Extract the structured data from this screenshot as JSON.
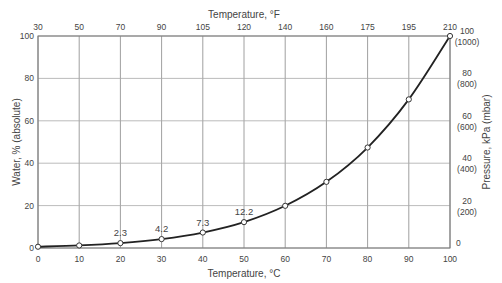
{
  "chart_data": {
    "type": "line",
    "title": "",
    "xlabel": "Temperature, °C",
    "x2label": "Temperature, °F",
    "ylabel": "Water, % (absolute)",
    "y2label": "Pressure, kPa (mbar)",
    "x": [
      0,
      10,
      20,
      30,
      40,
      50,
      60,
      70,
      80,
      90,
      100
    ],
    "series": [
      {
        "name": "Water vapor pressure",
        "values": [
          0.6,
          1.2,
          2.3,
          4.2,
          7.3,
          12.2,
          19.9,
          31.2,
          47.4,
          70.1,
          100
        ]
      }
    ],
    "annotations": [
      {
        "x": 20,
        "label": "2.3"
      },
      {
        "x": 30,
        "label": "4.2"
      },
      {
        "x": 40,
        "label": "7.3"
      },
      {
        "x": 50,
        "label": "12.2"
      }
    ],
    "xlim": [
      0,
      100
    ],
    "ylim": [
      0,
      100
    ],
    "x_ticks": [
      "0",
      "10",
      "20",
      "30",
      "40",
      "50",
      "60",
      "70",
      "80",
      "90",
      "100"
    ],
    "x2_ticks": [
      "30",
      "50",
      "70",
      "90",
      "105",
      "120",
      "140",
      "160",
      "175",
      "195",
      "210"
    ],
    "y_ticks": [
      "0",
      "20",
      "40",
      "60",
      "80",
      "100"
    ],
    "y2_ticks": [
      {
        "main": "0",
        "sub": ""
      },
      {
        "main": "20",
        "sub": "(200)"
      },
      {
        "main": "40",
        "sub": "(400)"
      },
      {
        "main": "60",
        "sub": "(600)"
      },
      {
        "main": "80",
        "sub": "(800)"
      },
      {
        "main": "100",
        "sub": "(1000)"
      }
    ],
    "grid": true,
    "legend": "none"
  }
}
